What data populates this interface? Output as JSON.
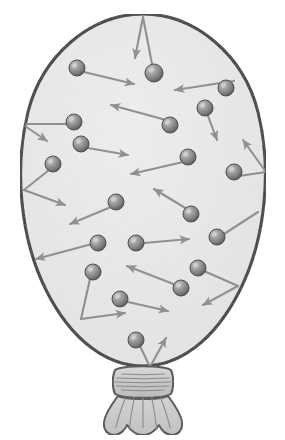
{
  "figure": {
    "canvas": {
      "width": 285,
      "height": 440
    }
  },
  "colors": {
    "page_background": "#ffffff",
    "balloon_outline": "#333333",
    "balloon_interior": "#eeeeee",
    "balloon_interior_speckle": "#d8d8d8",
    "neck_fill": "#cccccc",
    "neck_outline": "#4a4a4a",
    "neck_crease": "#8a8a8a",
    "molecule_fill_light": "#b4b4b4",
    "molecule_fill_mid": "#8c8c8c",
    "molecule_fill_dark": "#5a5a5a",
    "molecule_outline": "#4f4f4f",
    "velocity_arrow": "#909090"
  },
  "balloon": {
    "body_label": "balloon-envelope",
    "outline_width": 3,
    "body_path": "M 143 14 C 196 14 244 56 258 112 C 272 168 266 238 240 290 C 214 342 178 366 143 366 C 108 366 72 342 46 290 C 20 238 14 168 28 112 C 42 56 90 14 143 14 Z",
    "neck": {
      "knot_label": "balloon-knot",
      "knot_path": "M 115 370 C 112 377 112 387 115 394 C 124 399 162 399 171 394 C 174 387 174 377 171 370 C 162 365 124 365 115 370 Z",
      "knot_lines": 5,
      "skirt_label": "balloon-tail-skirt",
      "skirt_path": "M 118 396 C 112 404 105 414 104 422 C 103 430 108 435 114 435 C 120 435 125 430 127 425 C 131 431 136 435 143 435 C 150 435 155 431 159 425 C 161 430 166 435 172 435 C 178 435 183 430 182 422 C 181 414 174 404 168 396 C 160 400 126 400 118 396 Z",
      "skirt_creases": 5
    }
  },
  "molecules": [
    {
      "id": "m1",
      "cx": 77,
      "cy": 68,
      "r": 8
    },
    {
      "id": "m2",
      "cx": 154,
      "cy": 73,
      "r": 9
    },
    {
      "id": "m3",
      "cx": 226,
      "cy": 88,
      "r": 8
    },
    {
      "id": "m4",
      "cx": 205,
      "cy": 108,
      "r": 8
    },
    {
      "id": "m5",
      "cx": 74,
      "cy": 122,
      "r": 8
    },
    {
      "id": "m6",
      "cx": 170,
      "cy": 125,
      "r": 8
    },
    {
      "id": "m7",
      "cx": 81,
      "cy": 144,
      "r": 8
    },
    {
      "id": "m8",
      "cx": 53,
      "cy": 164,
      "r": 8
    },
    {
      "id": "m9",
      "cx": 188,
      "cy": 157,
      "r": 8
    },
    {
      "id": "m10",
      "cx": 234,
      "cy": 172,
      "r": 8
    },
    {
      "id": "m11",
      "cx": 116,
      "cy": 202,
      "r": 8
    },
    {
      "id": "m12",
      "cx": 191,
      "cy": 214,
      "r": 8
    },
    {
      "id": "m13",
      "cx": 98,
      "cy": 243,
      "r": 8
    },
    {
      "id": "m14",
      "cx": 136,
      "cy": 243,
      "r": 8
    },
    {
      "id": "m15",
      "cx": 217,
      "cy": 237,
      "r": 8
    },
    {
      "id": "m16",
      "cx": 93,
      "cy": 272,
      "r": 8
    },
    {
      "id": "m17",
      "cx": 198,
      "cy": 268,
      "r": 8
    },
    {
      "id": "m18",
      "cx": 181,
      "cy": 288,
      "r": 8
    },
    {
      "id": "m19",
      "cx": 120,
      "cy": 299,
      "r": 8
    },
    {
      "id": "m20",
      "cx": 136,
      "cy": 340,
      "r": 8
    }
  ],
  "velocity_vectors": [
    {
      "id": "v1",
      "label": "incoming-top-wall",
      "x1": 143,
      "y1": 17,
      "x2": 135,
      "y2": 58,
      "arrow": "end"
    },
    {
      "id": "v2",
      "label": "outgoing-top-wall",
      "x1": 143,
      "y1": 17,
      "x2": 152,
      "y2": 64,
      "arrow": "none"
    },
    {
      "id": "v3",
      "label": "m1-velocity",
      "x1": 84,
      "y1": 72,
      "x2": 134,
      "y2": 84,
      "arrow": "end"
    },
    {
      "id": "v4",
      "label": "m3-incoming",
      "x1": 234,
      "y1": 81,
      "x2": 175,
      "y2": 90,
      "arrow": "end"
    },
    {
      "id": "v5",
      "label": "m4-downward",
      "x1": 208,
      "y1": 116,
      "x2": 217,
      "y2": 140,
      "arrow": "end"
    },
    {
      "id": "v6",
      "label": "m6-up-left",
      "x1": 166,
      "y1": 120,
      "x2": 111,
      "y2": 105,
      "arrow": "end"
    },
    {
      "id": "v7",
      "label": "left-wall-incoming",
      "x1": 22,
      "y1": 124,
      "x2": 68,
      "y2": 124,
      "arrow": "none"
    },
    {
      "id": "v8",
      "label": "left-wall-outgoing",
      "x1": 22,
      "y1": 124,
      "x2": 47,
      "y2": 141,
      "arrow": "end"
    },
    {
      "id": "v9",
      "label": "m7-velocity",
      "x1": 88,
      "y1": 148,
      "x2": 128,
      "y2": 155,
      "arrow": "end"
    },
    {
      "id": "v10",
      "label": "m8-to-left-wall",
      "x1": 49,
      "y1": 170,
      "x2": 24,
      "y2": 190,
      "arrow": "none"
    },
    {
      "id": "v11",
      "label": "left-wall-rebound",
      "x1": 24,
      "y1": 190,
      "x2": 65,
      "y2": 205,
      "arrow": "end"
    },
    {
      "id": "v12",
      "label": "m9-to-center",
      "x1": 183,
      "y1": 162,
      "x2": 131,
      "y2": 174,
      "arrow": "end"
    },
    {
      "id": "v13",
      "label": "right-wall-incoming",
      "x1": 266,
      "y1": 172,
      "x2": 243,
      "y2": 140,
      "arrow": "end"
    },
    {
      "id": "v14",
      "label": "right-wall-outgoing",
      "x1": 266,
      "y1": 172,
      "x2": 239,
      "y2": 176,
      "arrow": "none"
    },
    {
      "id": "v15",
      "label": "m11-down-left",
      "x1": 111,
      "y1": 207,
      "x2": 70,
      "y2": 224,
      "arrow": "end"
    },
    {
      "id": "v16",
      "label": "m12-up-left",
      "x1": 187,
      "y1": 209,
      "x2": 154,
      "y2": 189,
      "arrow": "end"
    },
    {
      "id": "v17",
      "label": "m13-to-left-wall",
      "x1": 92,
      "y1": 244,
      "x2": 36,
      "y2": 259,
      "arrow": "end"
    },
    {
      "id": "v18",
      "label": "m14-right",
      "x1": 144,
      "y1": 243,
      "x2": 189,
      "y2": 239,
      "arrow": "end"
    },
    {
      "id": "v19",
      "label": "m15-right-wall",
      "x1": 224,
      "y1": 234,
      "x2": 258,
      "y2": 212,
      "arrow": "none"
    },
    {
      "id": "v20",
      "label": "m16-to-lower-left-wall",
      "x1": 90,
      "y1": 279,
      "x2": 81,
      "y2": 319,
      "arrow": "none"
    },
    {
      "id": "v21",
      "label": "lower-left-rebound",
      "x1": 81,
      "y1": 319,
      "x2": 125,
      "y2": 313,
      "arrow": "end"
    },
    {
      "id": "v22",
      "label": "m18-up-left",
      "x1": 176,
      "y1": 285,
      "x2": 127,
      "y2": 266,
      "arrow": "end"
    },
    {
      "id": "v23",
      "label": "m17-to-right-wall",
      "x1": 204,
      "y1": 271,
      "x2": 238,
      "y2": 286,
      "arrow": "none"
    },
    {
      "id": "v24",
      "label": "right-wall-rebound-low",
      "x1": 238,
      "y1": 286,
      "x2": 203,
      "y2": 305,
      "arrow": "end"
    },
    {
      "id": "v25",
      "label": "m19-right",
      "x1": 128,
      "y1": 302,
      "x2": 168,
      "y2": 311,
      "arrow": "end"
    },
    {
      "id": "v26",
      "label": "m20-to-neck",
      "x1": 140,
      "y1": 346,
      "x2": 150,
      "y2": 367,
      "arrow": "none"
    },
    {
      "id": "v27",
      "label": "neck-rebound",
      "x1": 150,
      "y1": 367,
      "x2": 166,
      "y2": 338,
      "arrow": "end"
    }
  ]
}
